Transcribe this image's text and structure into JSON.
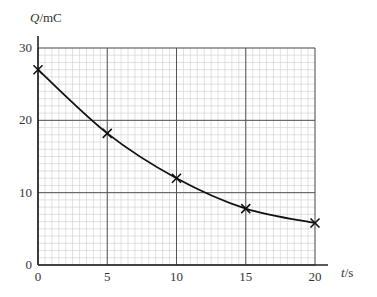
{
  "chart_data": {
    "type": "line",
    "title": "",
    "xlabel": "t/s",
    "ylabel": "Q/mC",
    "xlabel_var": "t",
    "xlabel_unit": "/s",
    "ylabel_var": "Q",
    "ylabel_unit": "/mC",
    "x": [
      0,
      5,
      10,
      15,
      20
    ],
    "series": [
      {
        "name": "Q",
        "values": [
          27.0,
          18.2,
          12.0,
          7.8,
          5.8
        ],
        "marker": "x",
        "smooth": true
      }
    ],
    "xlim": [
      0,
      20
    ],
    "ylim": [
      0,
      30
    ],
    "xticks": [
      0,
      5,
      10,
      15,
      20
    ],
    "yticks": [
      0,
      10,
      20,
      30
    ],
    "xtick_labels": [
      "0",
      "5",
      "10",
      "15",
      "20"
    ],
    "ytick_labels": [
      "0",
      "10",
      "20",
      "30"
    ],
    "grid": {
      "on": true,
      "major_x": 5,
      "major_y": 10,
      "minor_x": 0.5,
      "minor_y": 1
    },
    "legend": null
  },
  "colors": {
    "axis": "#222222",
    "major_grid": "#555555",
    "minor_grid": "#cccccc",
    "curve": "#111111",
    "text": "#333333"
  }
}
